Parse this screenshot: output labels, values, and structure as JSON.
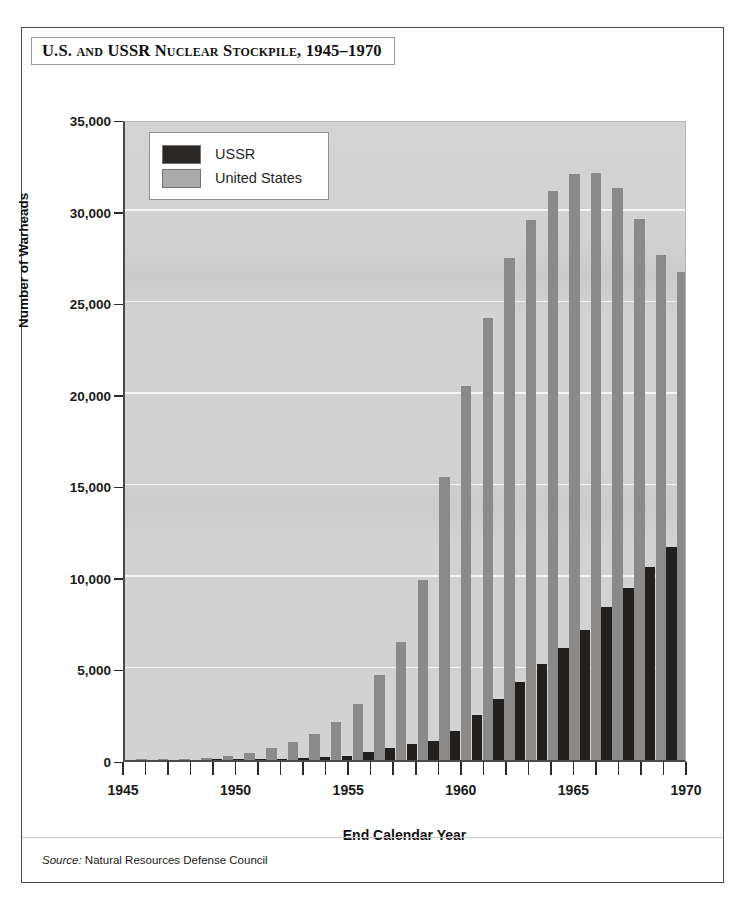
{
  "figure": {
    "title": "U.S. and USSR Nuclear Stockpile, 1945–1970",
    "source_label": "Source:",
    "source_text": " Natural Resources Defense Council",
    "artifact_text": ""
  },
  "legend": {
    "position": "top-left",
    "entries": [
      {
        "name": "USSR",
        "color": "#231f1c"
      },
      {
        "name": "United States",
        "color": "#a8a8a8"
      }
    ]
  },
  "axes": {
    "ylabel": "Number of Warheads",
    "xlabel": "End Calendar Year",
    "yticks": [
      "0",
      "5,000",
      "10,000",
      "15,000",
      "20,000",
      "25,000",
      "30,000",
      "35,000"
    ],
    "ytick_values": [
      0,
      5000,
      10000,
      15000,
      20000,
      25000,
      30000,
      35000
    ],
    "xticks": [
      "1945",
      "1950",
      "1955",
      "1960",
      "1965",
      "1970"
    ],
    "xtick_values": [
      1945,
      1950,
      1955,
      1960,
      1965,
      1970
    ]
  },
  "chart_data": {
    "type": "bar",
    "title": "U.S. and USSR Nuclear Stockpile, 1945–1970",
    "subtitle": "",
    "xlabel": "End Calendar Year",
    "ylabel": "Number of Warheads",
    "ylim": [
      0,
      35000
    ],
    "xlim": [
      1945,
      1970
    ],
    "grid": true,
    "legend_position": "top-left",
    "annotations": [
      "Source: Natural Resources Defense Council"
    ],
    "categories": [
      1945,
      1946,
      1947,
      1948,
      1949,
      1950,
      1951,
      1952,
      1953,
      1954,
      1955,
      1956,
      1957,
      1958,
      1959,
      1960,
      1961,
      1962,
      1963,
      1964,
      1965,
      1966,
      1967,
      1968,
      1969,
      1970
    ],
    "series": [
      {
        "name": "USSR",
        "color": "#231f1c",
        "values": [
          0,
          0,
          0,
          0,
          1,
          5,
          25,
          50,
          120,
          150,
          200,
          426,
          660,
          869,
          1060,
          1605,
          2471,
          3322,
          4238,
          5221,
          6129,
          7089,
          8339,
          9399,
          10538,
          11643
        ]
      },
      {
        "name": "United States",
        "color": "#8a8a8a",
        "values": [
          6,
          11,
          32,
          110,
          235,
          369,
          640,
          1005,
          1436,
          2063,
          3057,
          4618,
          6444,
          9822,
          15468,
          20434,
          24111,
          27387,
          29459,
          31056,
          31982,
          32040,
          31255,
          29561,
          27552,
          26662
        ]
      }
    ]
  }
}
